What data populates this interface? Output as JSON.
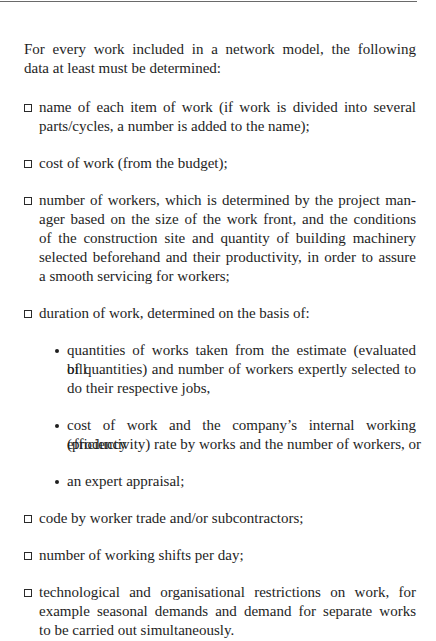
{
  "document": {
    "intro_lines": [
      "For every work included in a network model, the following",
      "data at least must be determined:"
    ],
    "items": [
      {
        "marker": "square-bullet",
        "lines": [
          "name of each item of work (if work is divided into several",
          "parts/cycles, a number is added to the name);"
        ]
      },
      {
        "marker": "square-bullet",
        "lines": [
          "cost of work (from the budget);"
        ]
      },
      {
        "marker": "square-bullet",
        "lines": [
          "number of workers, which is determined by the project man-",
          "ager based on the size of the work front, and the conditions",
          "of the construction site and quantity of building machinery",
          "selected beforehand and their productivity, in order to assure",
          "a smooth servicing for workers;"
        ]
      },
      {
        "marker": "square-bullet",
        "lines": [
          "duration of work, determined on the basis of:"
        ],
        "subitems": [
          {
            "marker": "round-bullet",
            "lines": [
              "quantities of works taken from the estimate (evaluated bill",
              "of quantities) and number of workers expertly selected to",
              "do their respective jobs,"
            ]
          },
          {
            "marker": "round-bullet",
            "lines": [
              "cost of work and the company’s internal working efficiency",
              "(productivity) rate by works and the number of workers, or"
            ]
          },
          {
            "marker": "round-bullet",
            "lines": [
              "an expert appraisal;"
            ]
          }
        ]
      },
      {
        "marker": "square-bullet",
        "lines": [
          "code by worker trade and/or subcontractors;"
        ]
      },
      {
        "marker": "square-bullet",
        "lines": [
          "number of working shifts per day;"
        ]
      },
      {
        "marker": "square-bullet",
        "lines": [
          "technological and organisational restrictions on work, for",
          "example seasonal demands and demand for separate works",
          "to be carried out simultaneously."
        ]
      }
    ]
  },
  "colors": {
    "text": "#1e1e1e",
    "rule": "#6a6a6a",
    "background": "#ffffff"
  }
}
